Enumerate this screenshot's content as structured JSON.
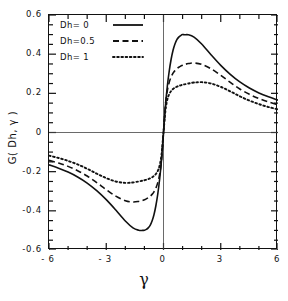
{
  "chart_data": {
    "type": "line",
    "title": "",
    "xlabel": "γ",
    "ylabel": "G( Dh, γ )",
    "xlim": [
      -6,
      6
    ],
    "ylim": [
      -0.6,
      0.6
    ],
    "xticks": [
      -6,
      -3,
      0,
      3,
      6
    ],
    "xtick_labels": [
      "- 6",
      "- 3",
      "0",
      "3",
      "6"
    ],
    "yticks": [
      0.6,
      0.4,
      0.2,
      0,
      -0.2,
      -0.4,
      -0.6
    ],
    "ytick_labels": [
      "0.6",
      "0.4",
      "0.2",
      "0",
      "-0.2",
      "-0.4",
      "-0.6"
    ],
    "x_minor_tick_step": 1,
    "y_minor_tick_step": 0.05,
    "grid": false,
    "zero_lines": {
      "horizontal": 0,
      "vertical": 0
    },
    "legend_position": "top-left",
    "x": [
      -6,
      -5.5,
      -5,
      -4.5,
      -4,
      -3.5,
      -3,
      -2.5,
      -2,
      -1.6,
      -1.3,
      -1.1,
      -1,
      -0.9,
      -0.8,
      -0.7,
      -0.6,
      -0.5,
      -0.4,
      -0.3,
      -0.2,
      -0.1,
      0,
      0.1,
      0.2,
      0.3,
      0.4,
      0.5,
      0.6,
      0.7,
      0.8,
      0.9,
      1,
      1.1,
      1.3,
      1.6,
      2,
      2.5,
      3,
      3.5,
      4,
      4.5,
      5,
      5.5,
      6
    ],
    "series": [
      {
        "name": "Dh= 0",
        "label": "Dh= 0",
        "style": "solid",
        "color": "#111111",
        "peak": {
          "x": 1.0,
          "y": 0.5
        },
        "trough": {
          "x": -1.0,
          "y": -0.5
        },
        "endpoints": {
          "left": -0.165,
          "right": 0.165
        },
        "values": [
          -0.165,
          -0.182,
          -0.202,
          -0.227,
          -0.258,
          -0.297,
          -0.343,
          -0.396,
          -0.452,
          -0.487,
          -0.499,
          -0.5,
          -0.499,
          -0.495,
          -0.487,
          -0.474,
          -0.452,
          -0.42,
          -0.374,
          -0.314,
          -0.236,
          -0.135,
          0,
          0.135,
          0.236,
          0.314,
          0.374,
          0.42,
          0.452,
          0.474,
          0.487,
          0.495,
          0.5,
          0.499,
          0.499,
          0.487,
          0.452,
          0.396,
          0.343,
          0.297,
          0.258,
          0.227,
          0.202,
          0.182,
          0.165
        ]
      },
      {
        "name": "Dh=0.5",
        "label": "Dh=0.5",
        "style": "dashed",
        "color": "#111111",
        "peak": {
          "x": 1.7,
          "y": 0.355
        },
        "trough": {
          "x": -1.7,
          "y": -0.355
        },
        "endpoints": {
          "left": -0.14,
          "right": 0.14
        },
        "values": [
          -0.142,
          -0.156,
          -0.173,
          -0.195,
          -0.222,
          -0.256,
          -0.292,
          -0.325,
          -0.348,
          -0.355,
          -0.352,
          -0.347,
          -0.343,
          -0.339,
          -0.333,
          -0.326,
          -0.316,
          -0.303,
          -0.284,
          -0.256,
          -0.213,
          -0.14,
          0,
          0.14,
          0.213,
          0.256,
          0.284,
          0.303,
          0.316,
          0.326,
          0.333,
          0.339,
          0.343,
          0.347,
          0.352,
          0.355,
          0.348,
          0.325,
          0.292,
          0.256,
          0.222,
          0.195,
          0.173,
          0.156,
          0.142
        ]
      },
      {
        "name": "Dh= 1",
        "label": "Dh= 1",
        "style": "dotted",
        "color": "#111111",
        "peak": {
          "x": 2.4,
          "y": 0.258
        },
        "trough": {
          "x": -2.4,
          "y": -0.258
        },
        "endpoints": {
          "left": -0.118,
          "right": 0.118
        },
        "values": [
          -0.118,
          -0.13,
          -0.145,
          -0.163,
          -0.185,
          -0.21,
          -0.233,
          -0.25,
          -0.257,
          -0.255,
          -0.25,
          -0.246,
          -0.244,
          -0.241,
          -0.238,
          -0.234,
          -0.229,
          -0.222,
          -0.212,
          -0.196,
          -0.168,
          -0.11,
          0,
          0.11,
          0.168,
          0.196,
          0.212,
          0.222,
          0.229,
          0.234,
          0.238,
          0.241,
          0.244,
          0.246,
          0.25,
          0.255,
          0.257,
          0.25,
          0.233,
          0.21,
          0.185,
          0.163,
          0.145,
          0.13,
          0.118
        ]
      }
    ]
  },
  "axes": {
    "x_title": "γ",
    "y_title": "G( Dh, γ )"
  }
}
